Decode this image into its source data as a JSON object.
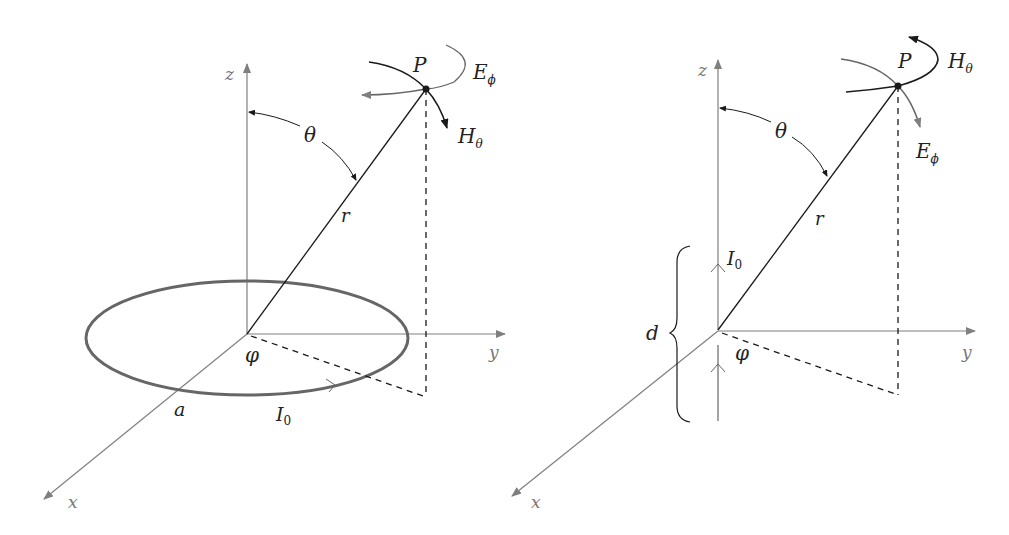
{
  "colors": {
    "axis": "#7f7f7f",
    "line": "#1a1a1a",
    "loop": "#666666",
    "field_gray": "#666666",
    "field_dark": "#1a1a1a",
    "background": "#ffffff"
  },
  "left_panel": {
    "name": "small loop antenna",
    "axes": {
      "z": "z",
      "y": "y",
      "x": "x"
    },
    "point": "P",
    "angle_theta": "θ",
    "angle_phi": "φ",
    "radius": "r",
    "loop_radius": "a",
    "current": {
      "main": "I",
      "sub": "0"
    },
    "field_e": {
      "main": "E",
      "sub": "ϕ"
    },
    "field_h": {
      "main": "H",
      "sub": "θ"
    }
  },
  "right_panel": {
    "name": "short dipole antenna",
    "axes": {
      "z": "z",
      "y": "y",
      "x": "x"
    },
    "point": "P",
    "angle_theta": "θ",
    "angle_phi": "φ",
    "radius": "r",
    "dipole_length": "d",
    "current": {
      "main": "I",
      "sub": "0"
    },
    "field_h": {
      "main": "H",
      "sub": "θ"
    },
    "field_e": {
      "main": "E",
      "sub": "ϕ"
    }
  }
}
